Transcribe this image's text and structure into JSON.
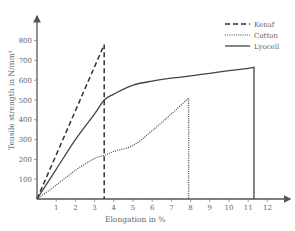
{
  "chart_data": {
    "type": "line",
    "title": "",
    "xlabel": "Elongation in %",
    "ylabel": "Tensile strength in N/mm²",
    "xlim": [
      0,
      13
    ],
    "ylim": [
      0,
      900
    ],
    "x_ticks": [
      1,
      2,
      3,
      4,
      5,
      6,
      7,
      8,
      9,
      10,
      11,
      12
    ],
    "y_ticks": [
      100,
      200,
      300,
      400,
      500,
      600,
      700,
      800
    ],
    "grid": false,
    "legend_position": "top-right",
    "series": [
      {
        "name": "Kenaf",
        "style": "dashed",
        "color": "#333333",
        "points": [
          [
            0,
            0
          ],
          [
            3.5,
            780
          ],
          [
            3.5,
            0
          ]
        ]
      },
      {
        "name": "Cotton",
        "style": "dotted",
        "color": "#444444",
        "points": [
          [
            0,
            0
          ],
          [
            1,
            70
          ],
          [
            2,
            145
          ],
          [
            3,
            205
          ],
          [
            3.5,
            220
          ],
          [
            4,
            240
          ],
          [
            5,
            270
          ],
          [
            6,
            345
          ],
          [
            7,
            430
          ],
          [
            7.9,
            510
          ],
          [
            7.9,
            0
          ]
        ]
      },
      {
        "name": "Lyocell",
        "style": "solid",
        "color": "#444444",
        "points": [
          [
            0,
            0
          ],
          [
            1,
            150
          ],
          [
            2,
            300
          ],
          [
            3,
            430
          ],
          [
            3.5,
            500
          ],
          [
            4,
            530
          ],
          [
            5,
            575
          ],
          [
            6,
            595
          ],
          [
            7,
            610
          ],
          [
            8,
            622
          ],
          [
            9,
            635
          ],
          [
            10,
            648
          ],
          [
            11,
            660
          ],
          [
            11.3,
            665
          ],
          [
            11.3,
            0
          ]
        ]
      }
    ]
  },
  "legend": {
    "items": [
      {
        "label": "Kenaf"
      },
      {
        "label": "Cotton"
      },
      {
        "label": "Lyocell"
      }
    ]
  },
  "axes": {
    "x_label": "Elongation in %",
    "y_label": "Tensile strength in N/mm²",
    "x_tick_labels": [
      "1",
      "2",
      "3",
      "4",
      "5",
      "6",
      "7",
      "8",
      "9",
      "10",
      "11",
      "12"
    ],
    "y_tick_labels": [
      "100",
      "200",
      "300",
      "400",
      "500",
      "600",
      "700",
      "800"
    ]
  }
}
